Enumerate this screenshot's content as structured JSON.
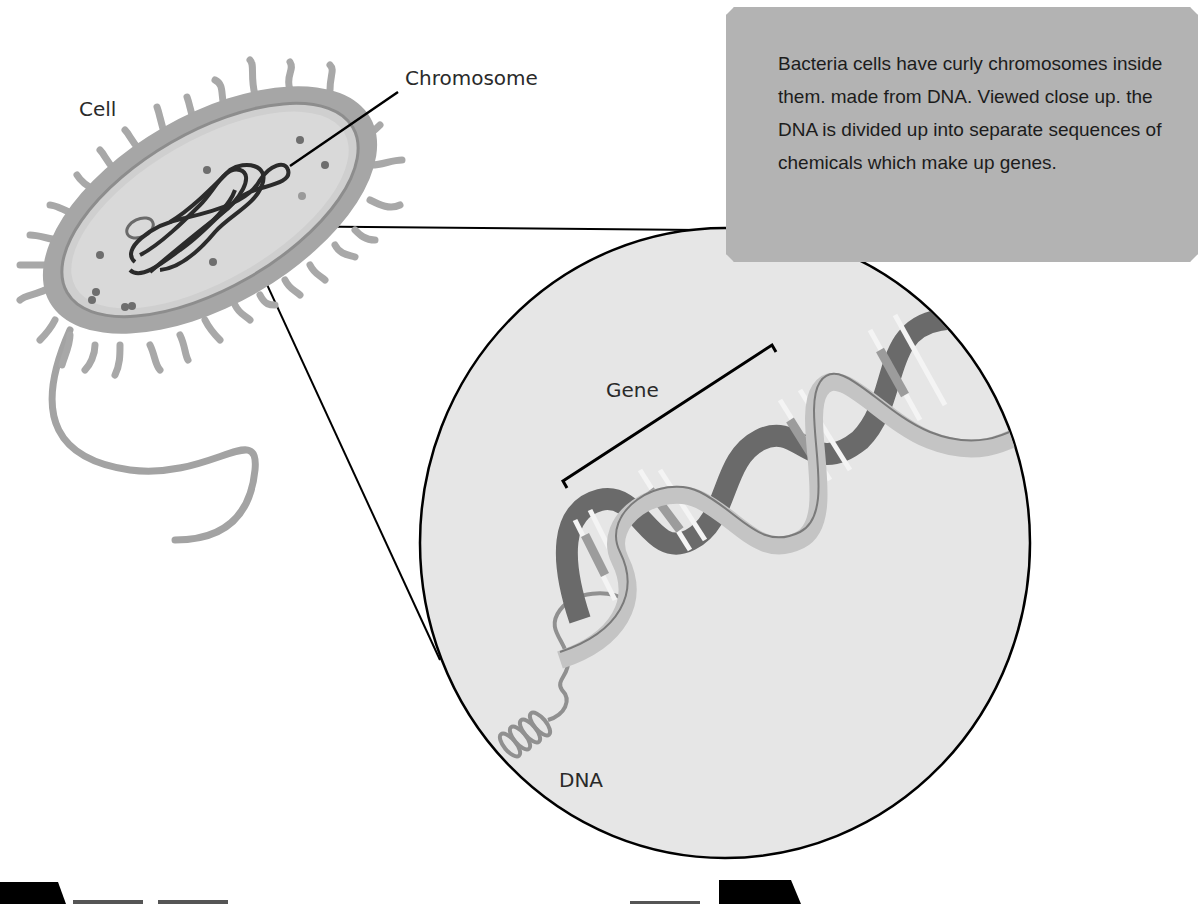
{
  "diagram": {
    "type": "labeled-illustration",
    "labels": {
      "cell": "Cell",
      "chromosome": "Chromosome",
      "gene": "Gene",
      "dna": "DNA"
    },
    "info_box": {
      "text": "Bacteria cells have curly chromosomes inside them. made from DNA. Viewed close up. the DNA is divided up into separate sequences of chemicals which make up genes."
    },
    "colors": {
      "background": "#ffffff",
      "info_box_fill": "#b3b3b3",
      "magnifier_fill": "#e6e6e6",
      "outline": "#000000",
      "cell_wall": "#9a9a9a",
      "cytoplasm": "#d4d4d4",
      "chromosome": "#2b2b2b",
      "dna_strand": "#8a8a8a"
    }
  }
}
